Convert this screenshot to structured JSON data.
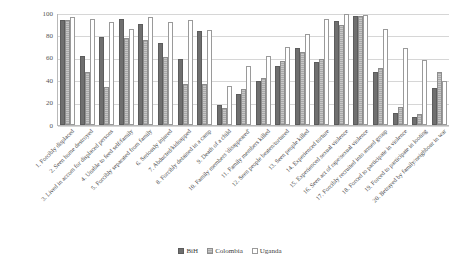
{
  "chart_data": {
    "type": "bar",
    "title": "",
    "subtitle": "",
    "xlabel": "",
    "ylabel": "",
    "ylim": [
      0,
      100
    ],
    "yticks": [
      0,
      20,
      40,
      60,
      80,
      100
    ],
    "grid": true,
    "legend_position": "bottom-center",
    "categories": [
      "1. Forcibly displaced",
      "2. Seen home destroyed",
      "3. Lived in accom for displaced persons",
      "4. Unable to feed self/family",
      "5. Forcibly separated from family",
      "6. Seriously injured",
      "7. Abducted/kidnapped",
      "8. Forcibly detained in a camp",
      "9. Death of a child",
      "10. Family members 'disappeared'",
      "11. Family members killed",
      "12. Seen people beaten/tortured",
      "13. Seen people killed",
      "14. Experienced torture",
      "15. Experienced sexual violence",
      "16. Seen act of rape/sexual violence",
      "17. Forcibly recruited into armed group",
      "18. Forced to participate in violence",
      "19. Forced to participate in looting",
      "20. Betrayed by family/neighbour in war"
    ],
    "series": [
      {
        "name": "BiH",
        "color": "#6f6f6f",
        "values": [
          94,
          62,
          79,
          95,
          90,
          73,
          59,
          84,
          18,
          28,
          39,
          53,
          69,
          56,
          93,
          97,
          47,
          11,
          7,
          33
        ]
      },
      {
        "name": "Colombia",
        "color": "#a9a9a9",
        "values": [
          94,
          47,
          34,
          78,
          76,
          61,
          37,
          37,
          15,
          32,
          42,
          57,
          65,
          59,
          89,
          97,
          51,
          16,
          10,
          47
        ]
      },
      {
        "name": "Uganda",
        "color": "#ffffff",
        "values": [
          96,
          95,
          92,
          86,
          96,
          92,
          94,
          85,
          35,
          53,
          62,
          70,
          81,
          95,
          99,
          98,
          86,
          69,
          58,
          39
        ]
      }
    ]
  },
  "legend": {
    "items": [
      {
        "label": "BiH"
      },
      {
        "label": "Colombia"
      },
      {
        "label": "Uganda"
      }
    ]
  }
}
